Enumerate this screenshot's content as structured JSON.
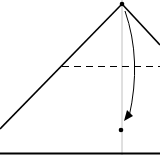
{
  "diagram": {
    "type": "origami-fold-step",
    "elements": [
      {
        "kind": "edge",
        "name": "left-edge"
      },
      {
        "kind": "edge",
        "name": "right-edge"
      },
      {
        "kind": "fold-line",
        "style": "dashed",
        "name": "valley-fold-line"
      },
      {
        "kind": "reference-line",
        "name": "center-crease"
      },
      {
        "kind": "point",
        "name": "top-point"
      },
      {
        "kind": "point",
        "name": "target-point"
      },
      {
        "kind": "arrow",
        "name": "fold-arrow"
      },
      {
        "kind": "edge",
        "name": "bottom-edge"
      }
    ],
    "colors": {
      "ink": "#000000",
      "crease": "#b0b0b0",
      "background": "#ffffff"
    }
  }
}
